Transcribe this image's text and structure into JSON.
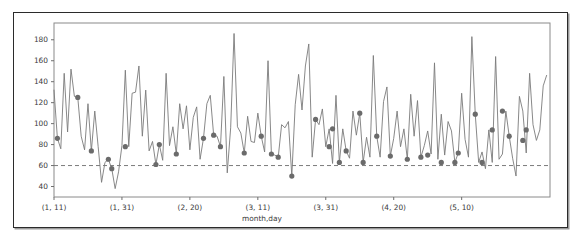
{
  "chart_data": {
    "type": "line",
    "title": "",
    "xlabel": "month,day",
    "ylabel": "",
    "grid": false,
    "legend": null,
    "xlim": [
      0,
      146
    ],
    "ylim": [
      30,
      196
    ],
    "yticks": [
      40,
      60,
      80,
      100,
      120,
      140,
      160,
      180
    ],
    "ytick_labels": [
      "40",
      "60",
      "80",
      "100",
      "120",
      "140",
      "160",
      "180"
    ],
    "xticks": [
      0,
      20,
      40,
      60,
      80,
      100,
      120
    ],
    "xtick_labels": [
      "(1, 11)",
      "(1, 31)",
      "(2, 20)",
      "(3, 11)",
      "(3, 31)",
      "(4, 20)",
      "(5, 10)"
    ],
    "threshold": {
      "value": 60,
      "style": "dashed",
      "color": "#7b7b7b"
    },
    "line_color": "#7b7b7b",
    "marker_color": "#6b6b6b",
    "series": [
      {
        "name": "daily value",
        "x": [
          0,
          1,
          2,
          3,
          4,
          5,
          6,
          7,
          8,
          9,
          10,
          11,
          12,
          13,
          14,
          15,
          16,
          17,
          18,
          19,
          20,
          21,
          22,
          23,
          24,
          25,
          26,
          27,
          28,
          29,
          30,
          31,
          32,
          33,
          34,
          35,
          36,
          37,
          38,
          39,
          40,
          41,
          42,
          43,
          44,
          45,
          46,
          47,
          48,
          49,
          50,
          51,
          52,
          53,
          54,
          55,
          56,
          57,
          58,
          59,
          60,
          61,
          62,
          63,
          64,
          65,
          66,
          67,
          68,
          69,
          70,
          71,
          72,
          73,
          74,
          75,
          76,
          77,
          78,
          79,
          80,
          81,
          82,
          83,
          84,
          85,
          86,
          87,
          88,
          89,
          90,
          91,
          92,
          93,
          94,
          95,
          96,
          97,
          98,
          99,
          100,
          101,
          102,
          103,
          104,
          105,
          106,
          107,
          108,
          109,
          110,
          111,
          112,
          113,
          114,
          115,
          116,
          117,
          118,
          119,
          120,
          121,
          122,
          123,
          124,
          125,
          126,
          127,
          128,
          129,
          130,
          131,
          132,
          133,
          134,
          135,
          136,
          137,
          138,
          139,
          140,
          141,
          142,
          143,
          144,
          145
        ],
        "values": [
          132,
          86,
          76,
          148,
          92,
          152,
          126,
          125,
          88,
          75,
          119,
          74,
          112,
          78,
          44,
          63,
          66,
          57,
          38,
          54,
          79,
          151,
          78,
          129,
          130,
          155,
          88,
          132,
          74,
          83,
          61,
          80,
          65,
          148,
          79,
          97,
          71,
          119,
          95,
          117,
          75,
          106,
          116,
          66,
          86,
          119,
          127,
          89,
          88,
          78,
          145,
          53,
          96,
          186,
          97,
          91,
          72,
          107,
          83,
          82,
          110,
          88,
          73,
          160,
          71,
          70,
          68,
          99,
          96,
          102,
          50,
          118,
          147,
          113,
          155,
          176,
          68,
          104,
          99,
          114,
          78,
          95,
          62,
          127,
          63,
          95,
          74,
          67,
          112,
          89,
          110,
          63,
          87,
          68,
          165,
          88,
          68,
          121,
          135,
          69,
          86,
          112,
          78,
          95,
          66,
          128,
          88,
          122,
          68,
          79,
          93,
          71,
          158,
          66,
          109,
          70,
          102,
          93,
          63,
          72,
          129,
          85,
          68,
          183,
          109,
          63,
          73,
          57,
          94,
          63,
          164,
          66,
          71,
          112,
          88,
          67,
          50,
          126,
          112,
          72,
          148,
          99,
          84,
          94,
          136,
          146
        ]
      }
    ],
    "markers": {
      "description": "highlighted daily points",
      "x": [
        1,
        7,
        11,
        16,
        17,
        21,
        30,
        31,
        36,
        44,
        47,
        49,
        56,
        61,
        64,
        66,
        70,
        77,
        81,
        82,
        84,
        86,
        90,
        91,
        95,
        99,
        104,
        108,
        110,
        114,
        118,
        119,
        124,
        126,
        129,
        132,
        134,
        138,
        139
      ],
      "values": [
        86,
        125,
        74,
        66,
        57,
        78,
        61,
        80,
        71,
        86,
        89,
        78,
        72,
        88,
        71,
        68,
        50,
        104,
        78,
        95,
        63,
        74,
        110,
        63,
        88,
        69,
        66,
        68,
        70,
        63,
        63,
        72,
        109,
        63,
        94,
        112,
        88,
        84,
        94
      ]
    }
  },
  "axis": {
    "x_title": "month,day"
  }
}
